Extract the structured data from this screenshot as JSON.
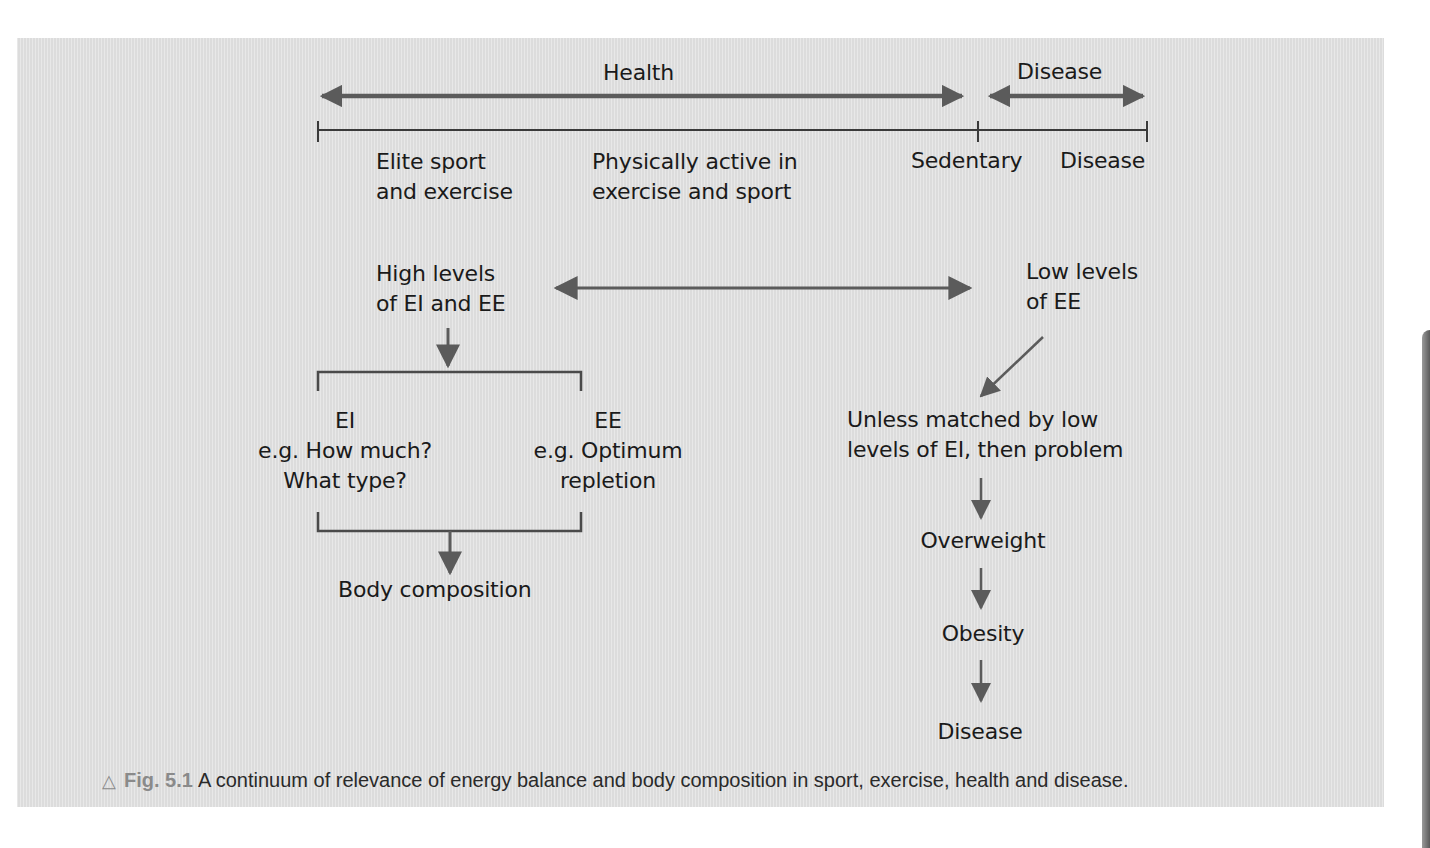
{
  "figure": {
    "number_label": "Fig. 5.1",
    "caption": "A continuum of relevance of energy balance and body composition in sport, exercise, health and disease.",
    "marker_icon": "triangle-outline-icon"
  },
  "continuum": {
    "health_label": "Health",
    "disease_label": "Disease",
    "scale_labels": {
      "elite": [
        "Elite sport",
        "and exercise"
      ],
      "active": [
        "Physically active in",
        "exercise and sport"
      ],
      "sedentary": "Sedentary",
      "disease": "Disease"
    }
  },
  "left_branch": {
    "high_levels": [
      "High levels",
      "of EI and EE"
    ],
    "ei": {
      "title": "EI",
      "lines": [
        "e.g. How much?",
        "What type?"
      ]
    },
    "ee": {
      "title": "EE",
      "lines": [
        "e.g. Optimum",
        "repletion"
      ]
    },
    "outcome": "Body composition"
  },
  "right_branch": {
    "low_levels": [
      "Low levels",
      "of EE"
    ],
    "condition": [
      "Unless matched by low",
      "levels of EI, then problem"
    ],
    "steps": [
      "Overweight",
      "Obesity",
      "Disease"
    ]
  },
  "colors": {
    "panel_bg": "#e3e3e3",
    "arrow": "#5b5b5b",
    "line": "#3a3a3a",
    "text": "#1a1a1a",
    "fig_label": "#8a8a8a"
  }
}
